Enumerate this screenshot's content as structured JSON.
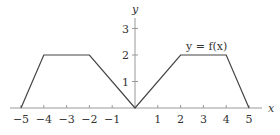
{
  "chart_data": {
    "type": "line",
    "title": "",
    "function_label": "y = f(x)",
    "xlabel": "x",
    "ylabel": "y",
    "x_ticks": [
      -5,
      -4,
      -3,
      -2,
      -1,
      1,
      2,
      3,
      4,
      5
    ],
    "x_tick_labels": [
      "−5",
      "−4",
      "−3",
      "−2",
      "−1",
      "1",
      "2",
      "3",
      "4",
      "5"
    ],
    "y_ticks": [
      1,
      2,
      3
    ],
    "y_tick_labels": [
      "1",
      "2",
      "3"
    ],
    "xlim": [
      -5.5,
      5.7
    ],
    "ylim": [
      0,
      3.4
    ],
    "grid": false,
    "series": [
      {
        "name": "f(x)",
        "x": [
          -5,
          -4,
          -2,
          0,
          2,
          4,
          5
        ],
        "y": [
          0,
          2,
          2,
          0,
          2,
          2,
          0
        ]
      }
    ],
    "colors": {
      "line": "#444444",
      "axis": "#999999",
      "text": "#333333"
    }
  }
}
